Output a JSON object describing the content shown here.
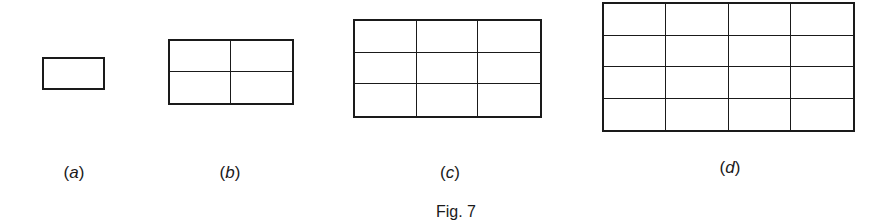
{
  "figure": {
    "caption": "Fig. 7",
    "panels": [
      {
        "id": "a",
        "label_open": "(",
        "label_letter": "a",
        "label_close": ")",
        "rows": 1,
        "cols": 1,
        "x": 42,
        "y": 57,
        "w": 63,
        "h": 33,
        "label_x": 74,
        "label_y": 163
      },
      {
        "id": "b",
        "label_open": "(",
        "label_letter": "b",
        "label_close": ")",
        "rows": 2,
        "cols": 2,
        "x": 168,
        "y": 39,
        "w": 126,
        "h": 66,
        "label_x": 230,
        "label_y": 163
      },
      {
        "id": "c",
        "label_open": "(",
        "label_letter": "c",
        "label_close": ")",
        "rows": 3,
        "cols": 3,
        "x": 353,
        "y": 19,
        "w": 189,
        "h": 99,
        "label_x": 450,
        "label_y": 163
      },
      {
        "id": "d",
        "label_open": "(",
        "label_letter": "d",
        "label_close": ")",
        "rows": 4,
        "cols": 4,
        "x": 602,
        "y": 2,
        "w": 253,
        "h": 130,
        "label_x": 730,
        "label_y": 158
      }
    ],
    "caption_x": 456,
    "caption_y": 203,
    "line_color": "#1a1a1a"
  }
}
